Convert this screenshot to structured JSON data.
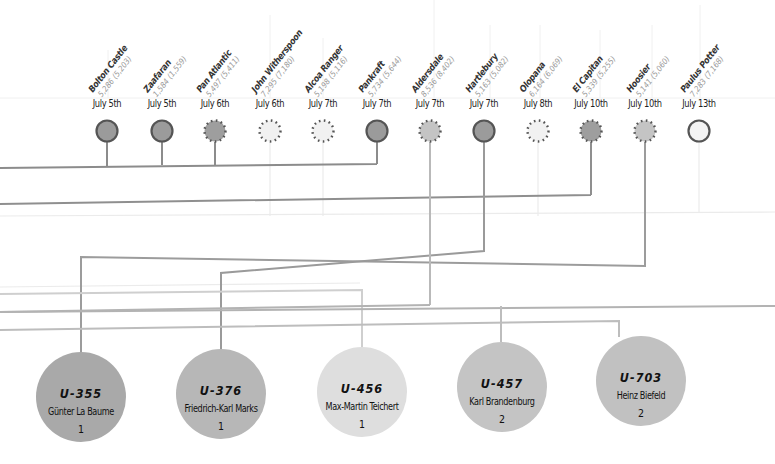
{
  "ships": [
    {
      "name": "Bolton Castle",
      "tonnage": "5,286 (5,203)",
      "date": "July 5th",
      "x": 107,
      "style": "sunk"
    },
    {
      "name": "Zaafaran",
      "tonnage": "1,584 (1,559)",
      "date": "July 5th",
      "x": 162,
      "style": "sunk"
    },
    {
      "name": "Pan Atlantic",
      "tonnage": "5,497 (5,411)",
      "date": "July 6th",
      "x": 215,
      "style": "sunk-dotted"
    },
    {
      "name": "John Witherspoon",
      "tonnage": "7,295 (7,180)",
      "date": "July 6th",
      "x": 270,
      "style": "light-dotted"
    },
    {
      "name": "Alcoa Ranger",
      "tonnage": "5,198 (5,116)",
      "date": "July 7th",
      "x": 323,
      "style": "light-dotted"
    },
    {
      "name": "Pankraft",
      "tonnage": "5,734 (5,644)",
      "date": "July 7th",
      "x": 377,
      "style": "sunk"
    },
    {
      "name": "Aldersdale",
      "tonnage": "8,536 (8,402)",
      "date": "July 7th",
      "x": 430,
      "style": "medium-dotted"
    },
    {
      "name": "Hartlebury",
      "tonnage": "5,163 (5,082)",
      "date": "July 7th",
      "x": 484,
      "style": "sunk"
    },
    {
      "name": "Olopana",
      "tonnage": "6,164 (6,069)",
      "date": "July 8th",
      "x": 538,
      "style": "light-dotted"
    },
    {
      "name": "El Capitan",
      "tonnage": "5,339 (5,255)",
      "date": "July 10th",
      "x": 591,
      "style": "sunk-dotted"
    },
    {
      "name": "Hoosier",
      "tonnage": "5,141 (5,060)",
      "date": "July 10th",
      "x": 645,
      "style": "medium-dotted"
    },
    {
      "name": "Paulus Potter",
      "tonnage": "7,283 (7,168)",
      "date": "July 13th",
      "x": 699,
      "style": "light-solid"
    }
  ],
  "uboats": [
    {
      "id": "U-355",
      "commander": "Günter La Baume",
      "count": "1",
      "x": 81,
      "y": 397,
      "r": 45,
      "color": "#a9a9a9"
    },
    {
      "id": "U-376",
      "commander": "Friedrich-Karl Marks",
      "count": "1",
      "x": 221,
      "y": 394,
      "r": 45,
      "color": "#b7b7b7"
    },
    {
      "id": "U-456",
      "commander": "Max-Martin Teichert",
      "count": "1",
      "x": 362,
      "y": 392,
      "r": 45,
      "color": "#dedede"
    },
    {
      "id": "U-457",
      "commander": "Karl Brandenburg",
      "count": "2",
      "x": 502,
      "y": 387,
      "r": 45,
      "color": "#c4c4c4"
    },
    {
      "id": "U-703",
      "commander": "Heinz Biefeld",
      "count": "2",
      "x": 641,
      "y": 381,
      "r": 45,
      "color": "#c1c1c1"
    }
  ],
  "colors": {
    "line_dark": "#8c8c8c",
    "line_mid": "#b0b0b0",
    "line_light": "#d4d4d4",
    "grid": "#eeeeee",
    "ship_sunk_fill": "#9b9b9b",
    "ship_stroke": "#555555"
  }
}
